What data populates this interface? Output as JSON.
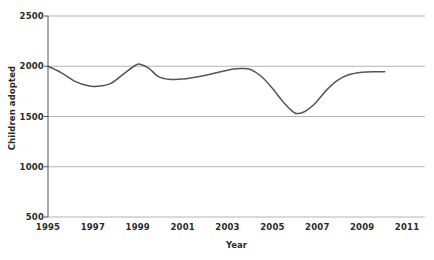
{
  "chart_data": {
    "type": "line",
    "title": "",
    "xlabel": "Year",
    "ylabel": "Children adopted",
    "xlim": [
      1995,
      2011.8
    ],
    "ylim": [
      500,
      2500
    ],
    "yticks": [
      2500,
      2000,
      1500,
      1000,
      500
    ],
    "xticks": [
      1995,
      1997,
      1999,
      2001,
      2003,
      2005,
      2007,
      2009,
      2011
    ],
    "grid": "horizontal",
    "legend": "none",
    "series": [
      {
        "name": "Children adopted",
        "x": [
          1995,
          1995.6,
          1996.2,
          1996.8,
          1997.2,
          1997.8,
          1998.4,
          1998.9,
          1999.1,
          1999.5,
          1999.9,
          2000.4,
          2001.0,
          2001.8,
          2002.6,
          2003.2,
          2003.6,
          2004.0,
          2004.5,
          2005.0,
          2005.5,
          2006.0,
          2006.4,
          2006.9,
          2007.4,
          2007.9,
          2008.4,
          2009.0,
          2009.6,
          2010.0
        ],
        "y": [
          2000,
          1935,
          1850,
          1805,
          1800,
          1830,
          1930,
          2010,
          2020,
          1980,
          1900,
          1870,
          1872,
          1900,
          1940,
          1970,
          1978,
          1970,
          1900,
          1780,
          1640,
          1535,
          1545,
          1630,
          1760,
          1860,
          1915,
          1940,
          1945,
          1945
        ]
      }
    ],
    "line_color": "#555555",
    "grid_color": "#b3b3b3",
    "axis_color": "#555555",
    "text_color": "#2b2b2b",
    "background": "#ffffff"
  },
  "axis": {
    "ylabel": "Children adopted",
    "xlabel": "Year",
    "yticks": [
      {
        "label": "2500"
      },
      {
        "label": "2000"
      },
      {
        "label": "1500"
      },
      {
        "label": "1000"
      },
      {
        "label": "500"
      }
    ],
    "xticks": [
      {
        "label": "1995"
      },
      {
        "label": "1997"
      },
      {
        "label": "1999"
      },
      {
        "label": "2001"
      },
      {
        "label": "2003"
      },
      {
        "label": "2005"
      },
      {
        "label": "2007"
      },
      {
        "label": "2009"
      },
      {
        "label": "2011"
      }
    ]
  }
}
